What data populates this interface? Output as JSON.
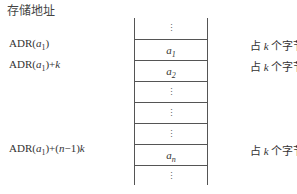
{
  "header": {
    "label": "存储地址"
  },
  "addresses": [
    {
      "text": "ADR(a1)"
    },
    {
      "text": "ADR(a1)+k"
    },
    {
      "text": "ADR(a1)+(n−1)k"
    }
  ],
  "cells": [
    {
      "label": "⋮"
    },
    {
      "label": "a1"
    },
    {
      "label": "a2"
    },
    {
      "label": "⋮"
    },
    {
      "label": "⋮"
    },
    {
      "label": "⋮"
    },
    {
      "label": "an"
    },
    {
      "label": "⋮"
    }
  ],
  "notes": [
    {
      "text": "占 k 个字节"
    },
    {
      "text": "占 k 个字节"
    },
    {
      "text": "占 k 个字节"
    }
  ]
}
